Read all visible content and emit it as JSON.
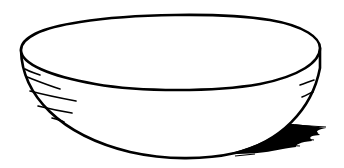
{
  "image": {
    "subject": "bowl line drawing",
    "background": "#ffffff",
    "stroke": "#000000"
  }
}
